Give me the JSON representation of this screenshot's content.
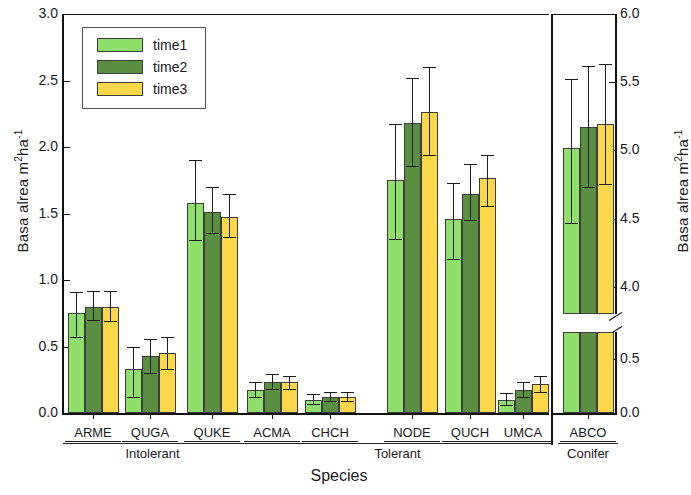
{
  "figure": {
    "xlabel": "Species",
    "ylabel_left": "Basa alrea m",
    "ylabel_left_sup": "2",
    "ylabel_left_tail": "ha",
    "ylabel_left_sup2": "-1",
    "ylabel_right": "Basa alrea m",
    "ylabel_right_sup": "2",
    "ylabel_right_tail": "ha",
    "ylabel_right_sup2": "-1"
  },
  "legend": {
    "entries": [
      {
        "label": "time1",
        "color": "#8ee06a"
      },
      {
        "label": "time2",
        "color": "#5a8f42"
      },
      {
        "label": "time3",
        "color": "#fbd849"
      }
    ]
  },
  "axes": {
    "left_ticks": [
      "3.0",
      "2.5",
      "2.0",
      "1.5",
      "1.0",
      "0.5",
      "0.0"
    ],
    "right_ticks": [
      "6.0",
      "5.5",
      "5.0",
      "4.5",
      "4.0",
      "0.5",
      "0.0"
    ]
  },
  "groups": [
    {
      "label": "Intolerant",
      "species": [
        "ARME",
        "QUGA",
        "QUKE"
      ]
    },
    {
      "label": "Tolerant",
      "species": [
        "ACMA",
        "CHCH",
        "NODE",
        "QUCH",
        "UMCA"
      ]
    },
    {
      "label": "Conifer",
      "species": [
        "ABCO"
      ]
    }
  ],
  "chart_data": {
    "type": "bar",
    "title": "",
    "xlabel": "Species",
    "ylabel": "Basal area m2ha-1",
    "ylim_left": [
      0.0,
      3.0
    ],
    "ylim_right_lower": [
      0.0,
      0.75
    ],
    "ylim_right_upper": [
      3.8,
      6.0
    ],
    "grid": false,
    "legend_position": "upper-left",
    "categories": [
      "ARME",
      "QUGA",
      "QUKE",
      "ACMA",
      "CHCH",
      "NODE",
      "QUCH",
      "UMCA",
      "ABCO"
    ],
    "category_groups": [
      "Intolerant",
      "Intolerant",
      "Intolerant",
      "Tolerant",
      "Tolerant",
      "Tolerant",
      "Tolerant",
      "Tolerant",
      "Conifer"
    ],
    "series": [
      {
        "name": "time1",
        "color": "#8ee06a",
        "values": [
          0.75,
          0.33,
          1.58,
          0.17,
          0.1,
          1.75,
          1.46,
          0.1,
          5.02
        ],
        "err_low": [
          0.57,
          0.12,
          1.3,
          0.12,
          0.07,
          1.31,
          1.16,
          0.06,
          4.47
        ],
        "err_high": [
          0.91,
          0.5,
          1.9,
          0.23,
          0.14,
          2.17,
          1.73,
          0.15,
          5.52
        ]
      },
      {
        "name": "time2",
        "color": "#5a8f42",
        "values": [
          0.8,
          0.43,
          1.51,
          0.23,
          0.12,
          2.18,
          1.65,
          0.17,
          5.17
        ],
        "err_low": [
          0.7,
          0.3,
          1.35,
          0.18,
          0.09,
          1.86,
          1.45,
          0.12,
          4.73
        ],
        "err_high": [
          0.92,
          0.56,
          1.7,
          0.29,
          0.16,
          2.52,
          1.87,
          0.23,
          5.62
        ]
      },
      {
        "name": "time3",
        "color": "#fbd849",
        "values": [
          0.8,
          0.45,
          1.47,
          0.23,
          0.12,
          2.26,
          1.77,
          0.22,
          5.19
        ],
        "err_low": [
          0.69,
          0.33,
          1.32,
          0.18,
          0.09,
          1.94,
          1.56,
          0.16,
          4.75
        ],
        "err_high": [
          0.92,
          0.57,
          1.65,
          0.28,
          0.16,
          2.6,
          1.94,
          0.28,
          5.63
        ]
      }
    ]
  }
}
